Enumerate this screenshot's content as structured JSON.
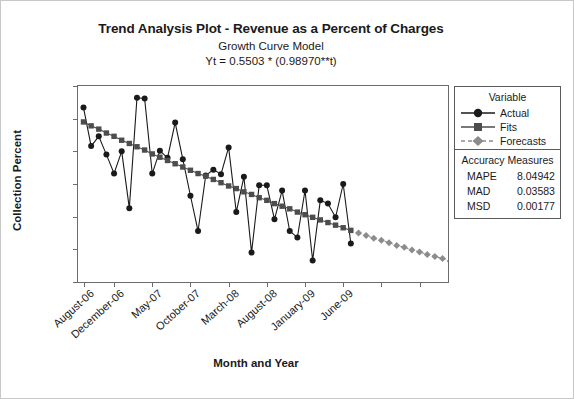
{
  "titles": {
    "main": "Trend Analysis Plot - Revenue as a Percent of Charges",
    "sub": "Growth Curve Model",
    "equation": "Yt = 0.5503 * (0.98970**t)"
  },
  "axes": {
    "y_title": "Collection Percent",
    "x_title": "Month and Year"
  },
  "legend": {
    "variable_header": "Variable",
    "entries": [
      {
        "label": "Actual",
        "marker": "circle",
        "color": "#1a1a1a",
        "line": "solid"
      },
      {
        "label": "Fits",
        "marker": "square",
        "color": "#4d4d4d",
        "line": "solid"
      },
      {
        "label": "Forecasts",
        "marker": "diamond",
        "color": "#8c8c8c",
        "line": "dashed"
      }
    ]
  },
  "accuracy": {
    "header": "Accuracy Measures",
    "rows": [
      {
        "name": "MAPE",
        "value": "8.04942"
      },
      {
        "name": "MAD",
        "value": "0.03583"
      },
      {
        "name": "MSD",
        "value": "0.00177"
      }
    ]
  },
  "chart_data": {
    "type": "line",
    "title": "Trend Analysis Plot - Revenue as a Percent of Charges",
    "subtitle": "Growth Curve Model",
    "annotation": "Yt = 0.5503 * (0.98970**t)",
    "xlabel": "Month and Year",
    "ylabel": "Collection Percent",
    "ylim": [
      0.3,
      0.6
    ],
    "y_ticks": [
      "0.60",
      "0.55",
      "0.50",
      "0.45",
      "0.40",
      "0.35",
      "0.30"
    ],
    "y_tick_values": [
      0.6,
      0.55,
      0.5,
      0.45,
      0.4,
      0.35,
      0.3
    ],
    "grid": false,
    "legend_position": "right-outside",
    "x_tick_labels": [
      "August-06",
      "December-06",
      "May-07",
      "October-07",
      "March-08",
      "August-08",
      "January-09",
      "June-09"
    ],
    "x_tick_indices": [
      0,
      4,
      9,
      14,
      19,
      24,
      29,
      34
    ],
    "x_untick_labeled_indices": [
      39,
      44
    ],
    "n_periods": 48,
    "series": [
      {
        "name": "Actual",
        "marker": "circle",
        "color": "#1a1a1a",
        "line": "solid",
        "x": [
          0,
          1,
          2,
          3,
          4,
          5,
          6,
          7,
          8,
          9,
          10,
          11,
          12,
          13,
          14,
          15,
          16,
          17,
          18,
          19,
          20,
          21,
          22,
          23,
          24,
          25,
          26,
          27,
          28,
          29,
          30,
          31,
          32,
          33,
          34,
          35
        ],
        "values": [
          0.567,
          0.508,
          0.523,
          0.495,
          0.466,
          0.5,
          0.413,
          0.582,
          0.581,
          0.466,
          0.501,
          0.49,
          0.544,
          0.488,
          0.432,
          0.378,
          0.463,
          0.472,
          0.465,
          0.506,
          0.407,
          0.461,
          0.345,
          0.448,
          0.448,
          0.396,
          0.44,
          0.378,
          0.368,
          0.44,
          0.333,
          0.425,
          0.42,
          0.399,
          0.45,
          0.359
        ]
      },
      {
        "name": "Fits",
        "marker": "square",
        "color": "#4d4d4d",
        "line": "solid",
        "x": [
          0,
          1,
          2,
          3,
          4,
          5,
          6,
          7,
          8,
          9,
          10,
          11,
          12,
          13,
          14,
          15,
          16,
          17,
          18,
          19,
          20,
          21,
          22,
          23,
          24,
          25,
          26,
          27,
          28,
          29,
          30,
          31,
          32,
          33,
          34,
          35
        ],
        "values": [
          0.545,
          0.539,
          0.534,
          0.528,
          0.523,
          0.517,
          0.512,
          0.507,
          0.502,
          0.496,
          0.491,
          0.486,
          0.481,
          0.476,
          0.471,
          0.466,
          0.462,
          0.457,
          0.452,
          0.447,
          0.443,
          0.438,
          0.434,
          0.429,
          0.425,
          0.42,
          0.416,
          0.412,
          0.407,
          0.403,
          0.399,
          0.395,
          0.391,
          0.387,
          0.383,
          0.379
        ]
      },
      {
        "name": "Forecasts",
        "marker": "diamond",
        "color": "#8c8c8c",
        "line": "dashed",
        "x": [
          36,
          37,
          38,
          39,
          40,
          41,
          42,
          43,
          44,
          45,
          46,
          47,
          48,
          49,
          50,
          51,
          52,
          53
        ],
        "values": [
          0.375,
          0.371,
          0.367,
          0.364,
          0.36,
          0.356,
          0.353,
          0.349,
          0.346,
          0.342,
          0.339,
          0.336,
          0.332,
          0.329,
          0.326,
          0.322,
          0.319,
          0.316
        ]
      }
    ]
  }
}
